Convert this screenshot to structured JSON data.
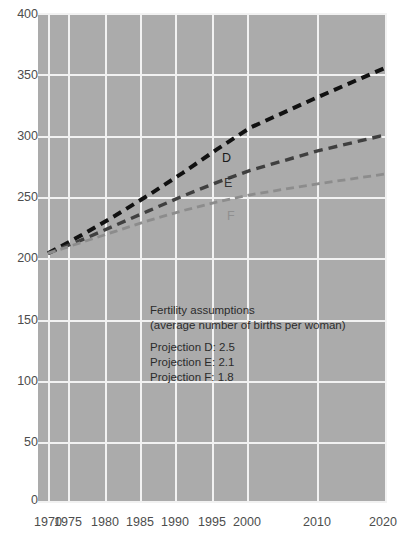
{
  "chart_data": {
    "type": "line",
    "title": "",
    "subtitle": "",
    "xlabel": "",
    "ylabel": "",
    "xlim": [
      1970,
      2020
    ],
    "ylim": [
      0,
      400
    ],
    "grid": true,
    "legend_position": "inline-end-labels",
    "x_ticks": [
      "1970",
      "1975",
      "1980",
      "1985",
      "1990",
      "1995",
      "2000",
      "2010",
      "2020"
    ],
    "x_tick_values": [
      1970,
      1975,
      1980,
      1985,
      1990,
      1995,
      2000,
      2010,
      2020
    ],
    "y_ticks": [
      "0",
      "50",
      "100",
      "150",
      "200",
      "250",
      "300",
      "350",
      "400"
    ],
    "y_tick_values": [
      0,
      50,
      100,
      150,
      200,
      250,
      300,
      350,
      400
    ],
    "x": [
      1970,
      1975,
      1980,
      1985,
      1990,
      1995,
      2000,
      2010,
      2020
    ],
    "series": [
      {
        "name": "D",
        "label": "D",
        "color": "#111111",
        "style": "dashed",
        "values": [
          203,
          218,
          234,
          251,
          269,
          288,
          306,
          331,
          355
        ]
      },
      {
        "name": "E",
        "label": "E",
        "color": "#3f3f3f",
        "style": "dashed",
        "values": [
          203,
          214,
          226,
          238,
          250,
          261,
          271,
          287,
          300
        ]
      },
      {
        "name": "F",
        "label": "F",
        "color": "#8c8c8c",
        "style": "dashed",
        "values": [
          203,
          212,
          221,
          230,
          238,
          245,
          251,
          260,
          268
        ]
      }
    ],
    "annotation": {
      "heading": "Fertility assumptions",
      "subheading": "(average number of births per woman)",
      "rows": [
        "Projection D: 2.5",
        "Projection E: 2.1",
        "Projection F: 1.8"
      ]
    },
    "colors": {
      "plot_background": "#ababab",
      "gridline": "#f2f2f2",
      "page_background": "#ffffff",
      "tick_label": "#4d4d4d",
      "annotation_text": "#2b2b2b"
    }
  }
}
